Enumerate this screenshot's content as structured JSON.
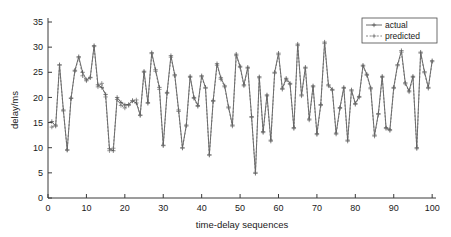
{
  "figure": {
    "width": 451,
    "height": 237,
    "background": "#ffffff",
    "axis_color": "#3a3a3a"
  },
  "chart_data": {
    "type": "line",
    "title": "",
    "xlabel": "time-delay sequences",
    "ylabel": "delay/ms",
    "xlim": [
      0,
      101
    ],
    "ylim": [
      0,
      35
    ],
    "xticks": [
      0,
      10,
      20,
      30,
      40,
      50,
      60,
      70,
      80,
      90,
      100
    ],
    "xticklabels": [
      "0",
      "10",
      "20",
      "30",
      "40",
      "50",
      "60",
      "70",
      "80",
      "90",
      "100"
    ],
    "yticks": [
      0,
      5,
      10,
      15,
      20,
      25,
      30,
      35
    ],
    "yticklabels": [
      "0",
      "5",
      "10",
      "15",
      "20",
      "25",
      "30",
      "35"
    ],
    "grid": false,
    "legend_position": "upper right",
    "legend_entries": [
      "actual",
      "predicted"
    ],
    "marker": "+",
    "x": [
      1,
      2,
      3,
      4,
      5,
      6,
      7,
      8,
      9,
      10,
      11,
      12,
      13,
      14,
      15,
      16,
      17,
      18,
      19,
      20,
      21,
      22,
      23,
      24,
      25,
      26,
      27,
      28,
      29,
      30,
      31,
      32,
      33,
      34,
      35,
      36,
      37,
      38,
      39,
      40,
      41,
      42,
      43,
      44,
      45,
      46,
      47,
      48,
      49,
      50,
      51,
      52,
      53,
      54,
      55,
      56,
      57,
      58,
      59,
      60,
      61,
      62,
      63,
      64,
      65,
      66,
      67,
      68,
      69,
      70,
      71,
      72,
      73,
      74,
      75,
      76,
      77,
      78,
      79,
      80,
      81,
      82,
      83,
      84,
      85,
      86,
      87,
      88,
      89,
      90,
      91,
      92,
      93,
      94,
      95,
      96,
      97,
      98,
      99,
      100
    ],
    "series": [
      {
        "name": "actual",
        "style": "solid",
        "color": "#4a4a4a",
        "values": [
          15.2,
          14.3,
          26.5,
          17.5,
          9.5,
          19.8,
          25.4,
          28.1,
          25.0,
          23.5,
          24.0,
          30.3,
          22.5,
          22.0,
          20.6,
          9.8,
          9.4,
          20.0,
          19.0,
          18.5,
          18.6,
          19.3,
          18.9,
          16.5,
          25.2,
          19.0,
          28.9,
          25.5,
          22.0,
          10.5,
          21.0,
          28.3,
          24.5,
          17.5,
          10.0,
          14.5,
          24.2,
          20.0,
          18.4,
          24.3,
          22.0,
          8.6,
          19.4,
          26.7,
          23.9,
          22.3,
          18.1,
          14.5,
          28.6,
          26.2,
          22.5,
          26.0,
          16.2,
          4.9,
          24.1,
          13.2,
          20.5,
          11.5,
          25.0,
          28.8,
          21.8,
          23.8,
          22.8,
          14.0,
          30.6,
          20.5,
          26.0,
          15.7,
          22.3,
          12.8,
          18.6,
          31.0,
          22.5,
          21.6,
          12.9,
          18.0,
          22.0,
          11.5,
          21.5,
          18.8,
          20.2,
          26.4,
          24.6,
          21.9,
          12.5,
          16.8,
          24.2,
          14.0,
          13.6,
          22.0,
          26.5,
          29.3,
          22.9,
          21.3,
          24.2,
          10.0,
          29.0,
          25.1,
          22.0,
          27.3
        ]
      },
      {
        "name": "predicted",
        "style": "dotted",
        "color": "#6e6e6e",
        "values": [
          14.1,
          14.5,
          26.4,
          17.3,
          9.6,
          19.9,
          25.2,
          27.9,
          24.3,
          23.3,
          23.9,
          30.1,
          22.1,
          22.8,
          20.1,
          9.4,
          9.9,
          19.6,
          18.4,
          17.9,
          18.4,
          19.4,
          19.5,
          16.4,
          25.0,
          18.8,
          28.7,
          25.2,
          21.6,
          10.4,
          20.8,
          28.0,
          24.3,
          17.2,
          9.9,
          14.3,
          24.0,
          19.8,
          18.2,
          24.1,
          21.8,
          8.5,
          19.2,
          26.4,
          23.6,
          22.1,
          17.9,
          14.3,
          28.3,
          26.0,
          22.3,
          25.8,
          16.0,
          5.1,
          23.9,
          13.0,
          20.3,
          11.3,
          24.8,
          28.5,
          21.6,
          23.5,
          22.6,
          13.8,
          30.3,
          20.3,
          25.8,
          15.5,
          22.1,
          12.6,
          18.4,
          30.7,
          22.3,
          21.4,
          12.7,
          17.8,
          21.8,
          11.3,
          21.3,
          18.6,
          20.0,
          26.2,
          24.4,
          21.7,
          12.3,
          16.6,
          24.0,
          13.8,
          13.4,
          21.8,
          26.3,
          29.0,
          22.7,
          21.1,
          24.0,
          9.8,
          28.8,
          24.9,
          21.8,
          27.1
        ]
      }
    ]
  }
}
